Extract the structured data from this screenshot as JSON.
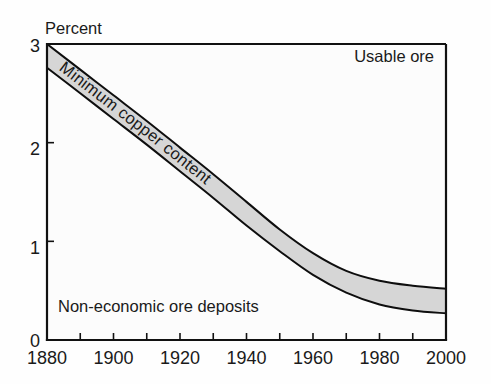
{
  "chart_data": {
    "type": "area",
    "title": "",
    "subtitle": "",
    "xlabel": "",
    "ylabel": "Percent",
    "xlim": [
      1880,
      2000
    ],
    "ylim": [
      0,
      3
    ],
    "grid": false,
    "legend_position": "none",
    "x_ticks_major": [
      1880,
      1900,
      1920,
      1940,
      1960,
      1980,
      2000
    ],
    "x_ticks_minor": [
      1890,
      1910,
      1930,
      1950,
      1970,
      1990
    ],
    "x_tick_labels": [
      "1880",
      "1900",
      "1920",
      "1940",
      "1960",
      "1980",
      "2000"
    ],
    "y_ticks": [
      0,
      1,
      2,
      3
    ],
    "y_tick_labels": [
      "0",
      "1",
      "2",
      "3"
    ],
    "x": [
      1880,
      1890,
      1900,
      1910,
      1920,
      1930,
      1940,
      1950,
      1960,
      1970,
      1980,
      1990,
      2000
    ],
    "series": [
      {
        "name": "Minimum copper content - upper bound",
        "values": [
          3.0,
          2.74,
          2.48,
          2.22,
          1.95,
          1.68,
          1.4,
          1.12,
          0.88,
          0.7,
          0.6,
          0.55,
          0.52
        ]
      },
      {
        "name": "Minimum copper content - lower bound",
        "values": [
          2.76,
          2.5,
          2.24,
          1.98,
          1.71,
          1.44,
          1.16,
          0.9,
          0.66,
          0.48,
          0.36,
          0.3,
          0.27
        ]
      }
    ],
    "annotations": [
      {
        "text": "Usable ore",
        "region": "above-band",
        "x": 1975,
        "y": 2.77
      },
      {
        "text": "Minimum copper content",
        "region": "inside-band",
        "x": 1920,
        "y": 1.8
      },
      {
        "text": "Non-economic ore deposits",
        "region": "below-band",
        "x": 1897,
        "y": 0.42
      }
    ],
    "colors": {
      "band_fill": "#d6d6d6",
      "band_edge": "#0e0e0e",
      "axis": "#111111",
      "text": "#1a1a1a",
      "background": "#fefefe"
    }
  },
  "labels": {
    "y_axis_title": "Percent",
    "usable_ore": "Usable ore",
    "band_name": "Minimum copper content",
    "non_economic": "Non-economic ore deposits",
    "y0": "0",
    "y1": "1",
    "y2": "2",
    "y3": "3",
    "x1880": "1880",
    "x1900": "1900",
    "x1920": "1920",
    "x1940": "1940",
    "x1960": "1960",
    "x1980": "1980",
    "x2000": "2000"
  }
}
